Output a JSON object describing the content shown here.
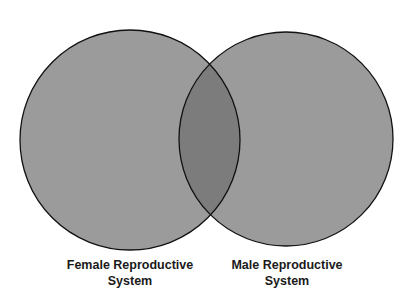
{
  "diagram": {
    "type": "venn",
    "sets": [
      {
        "id": "female",
        "label_line1": "Female Reproductive",
        "label_line2": "System"
      },
      {
        "id": "male",
        "label_line1": "Male Reproductive",
        "label_line2": "System"
      }
    ],
    "colors": {
      "background": "#ffffff",
      "circle_fill": "#9b9b9b",
      "overlap_fill": "#7c7c7c",
      "outline": "#111111",
      "text": "#1a1a1a"
    }
  }
}
